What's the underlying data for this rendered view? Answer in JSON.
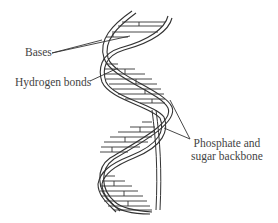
{
  "figure": {
    "labels": {
      "bases": "Bases",
      "hydrogen_bonds": "Hydrogen bonds",
      "backbone_line1": "Phosphate and",
      "backbone_line2": "sugar backbone"
    },
    "colors": {
      "stroke": "#333333",
      "text": "#444444",
      "background": "#ffffff"
    }
  }
}
